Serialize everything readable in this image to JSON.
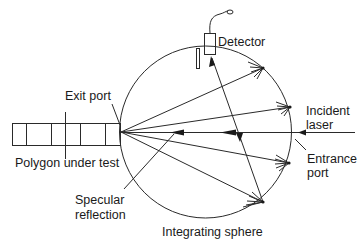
{
  "diagram": {
    "labels": {
      "detector": "Detector",
      "exit_port": "Exit port",
      "incident_laser_line1": "Incident",
      "incident_laser_line2": "laser",
      "polygon": "Polygon under test",
      "entrance_port_line1": "Entrance",
      "entrance_port_line2": "port",
      "specular_line1": "Specular",
      "specular_line2": "reflection",
      "sphere": "Integrating sphere"
    },
    "components": [
      {
        "id": "integrating-sphere",
        "shape": "circle"
      },
      {
        "id": "detector",
        "shape": "rect"
      },
      {
        "id": "baffle",
        "shape": "rect"
      },
      {
        "id": "polygon-under-test",
        "shape": "rect",
        "facets": 5
      },
      {
        "id": "incident-laser",
        "shape": "line"
      },
      {
        "id": "scattered-rays",
        "count": 4
      }
    ],
    "colors": {
      "line": "#2a2a2a",
      "text": "#1a1a1a",
      "background": "#ffffff"
    }
  }
}
